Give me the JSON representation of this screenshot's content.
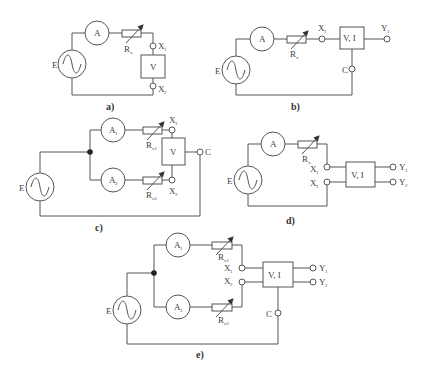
{
  "figure": {
    "panels": [
      {
        "id": "a",
        "caption": "a)",
        "source": "E",
        "ammeters": [
          "A"
        ],
        "resistors": [
          {
            "label": "R",
            "sub": "x"
          }
        ],
        "device": "V",
        "terminals": [
          {
            "label": "X",
            "sub": "1"
          },
          {
            "label": "X",
            "sub": "2"
          }
        ]
      },
      {
        "id": "b",
        "caption": "b)",
        "source": "E",
        "ammeters": [
          "A"
        ],
        "resistors": [
          {
            "label": "R",
            "sub": "x"
          }
        ],
        "device": "V, I",
        "terminals": [
          {
            "label": "X",
            "sub": "1"
          },
          {
            "label": "Y",
            "sub": "1"
          },
          {
            "label": "C",
            "sub": ""
          }
        ]
      },
      {
        "id": "c",
        "caption": "c)",
        "source": "E",
        "ammeters": [
          {
            "label": "A",
            "sub": "1"
          },
          {
            "label": "A",
            "sub": "2"
          }
        ],
        "resistors": [
          {
            "label": "R",
            "sub": "x1"
          },
          {
            "label": "R",
            "sub": "x2"
          }
        ],
        "device": "V",
        "terminals": [
          {
            "label": "X",
            "sub": "1"
          },
          {
            "label": "X",
            "sub": "2"
          },
          {
            "label": "C",
            "sub": ""
          }
        ]
      },
      {
        "id": "d",
        "caption": "d)",
        "source": "E",
        "ammeters": [
          "A"
        ],
        "resistors": [
          {
            "label": "R",
            "sub": "x"
          }
        ],
        "device": "V, I",
        "terminals": [
          {
            "label": "X",
            "sub": "1"
          },
          {
            "label": "X",
            "sub": "2"
          },
          {
            "label": "Y",
            "sub": "1"
          },
          {
            "label": "Y",
            "sub": "2"
          }
        ]
      },
      {
        "id": "e",
        "caption": "e)",
        "source": "E",
        "ammeters": [
          {
            "label": "A",
            "sub": "1"
          },
          {
            "label": "A",
            "sub": "2"
          }
        ],
        "resistors": [
          {
            "label": "R",
            "sub": "x1"
          },
          {
            "label": "R",
            "sub": "x2"
          }
        ],
        "device": "V, I",
        "terminals": [
          {
            "label": "X",
            "sub": "1"
          },
          {
            "label": "X",
            "sub": "2"
          },
          {
            "label": "Y",
            "sub": "1"
          },
          {
            "label": "Y",
            "sub": "2"
          },
          {
            "label": "C",
            "sub": ""
          }
        ]
      }
    ]
  },
  "labels": {
    "E": "E",
    "A": "A",
    "A1": "A",
    "A2": "A",
    "sub1": "1",
    "sub2": "2",
    "R": "R",
    "subx": "x",
    "subx1": "x1",
    "subx2": "x2",
    "X": "X",
    "Y": "Y",
    "C": "C",
    "V": "V",
    "VI": "V, I",
    "cap_a": "a)",
    "cap_b": "b)",
    "cap_c": "c)",
    "cap_d": "d)",
    "cap_e": "e)"
  },
  "colors": {
    "line": "#555555",
    "text": "#444444",
    "background": "#ffffff"
  }
}
